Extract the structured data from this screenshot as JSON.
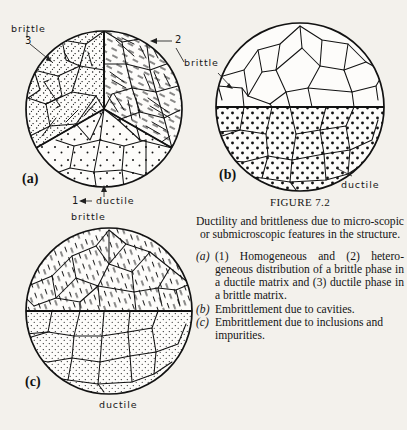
{
  "figure": {
    "title_main": "F",
    "title_rest": "IGURE",
    "number": "7.2",
    "title_full": "FIGURE 7.2"
  },
  "caption": {
    "lead": "Ductility and brittleness due to micro-scopic or submicroscopic features in the structure.",
    "items": [
      {
        "key": "(a)",
        "text": "(1) Homogeneous and (2) hetero-geneous distribution of a brittle phase in a ductile matrix and (3) ductile phase in a brittle matrix."
      },
      {
        "key": "(b)",
        "text": "Embrittlement due to cavities."
      },
      {
        "key": "(c)",
        "text": "Embrittlement due to inclusions and impurities."
      }
    ]
  },
  "panels": {
    "a": {
      "id": "(a)",
      "label_brittle_top_left": "brittle",
      "label_number_3": "3",
      "label_number_2": "2",
      "label_number_1": "1",
      "label_ductile_bottom": "ductile"
    },
    "b": {
      "id": "(b)",
      "label_brittle": "brittle",
      "label_ductile": "ductile"
    },
    "c": {
      "id": "(c)",
      "label_brittle_top": "brittle",
      "label_ductile_bottom": "ductile"
    }
  },
  "colors": {
    "paper": "#f3f1ec",
    "ink": "#121212"
  }
}
